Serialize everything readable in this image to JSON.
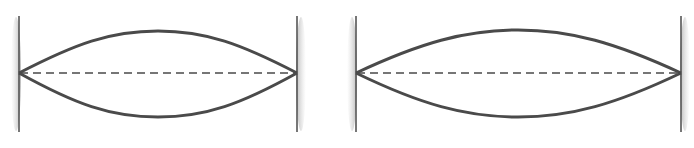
{
  "figure": {
    "colors": {
      "string": "#4a4a4a",
      "wall_line": "#555555",
      "wall_shade": "#bdbdbd",
      "equilibrium_dash": "#4a4a4a"
    },
    "panels": [
      {
        "id": "left",
        "left_wall_x": 19,
        "right_wall_x": 297,
        "wall_top": 16,
        "wall_bottom": 132,
        "axis_y": 73,
        "crest_y": 31,
        "trough_y": 117
      },
      {
        "id": "right",
        "left_wall_x": 356,
        "right_wall_x": 681,
        "wall_top": 16,
        "wall_bottom": 132,
        "axis_y": 73,
        "crest_y": 30,
        "trough_y": 117
      }
    ]
  }
}
